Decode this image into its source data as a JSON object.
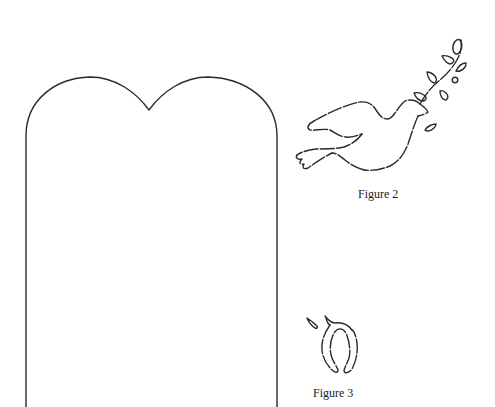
{
  "page": {
    "background": "#ffffff",
    "line_color": "#2a2a2a"
  },
  "figures": [
    {
      "id": "tablet",
      "description": "Double-arched tablet outline pattern",
      "caption": ""
    },
    {
      "id": "figure-2",
      "description": "Dove carrying olive branch, dashed cut-line outline",
      "caption": "Figure 2"
    },
    {
      "id": "figure-3",
      "description": "Small wishbone/seed shape with leaf, dashed outline",
      "caption": "Figure 3"
    }
  ]
}
